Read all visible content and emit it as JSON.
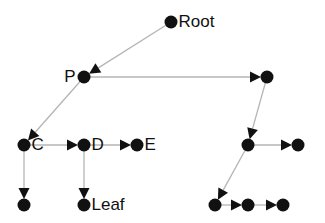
{
  "diagram": {
    "type": "tree",
    "colors": {
      "node": "#111111",
      "edge": "#b5b5b5",
      "arrow": "#111111",
      "label": "#111111",
      "background": "#ffffff"
    },
    "nodes": [
      {
        "id": "root",
        "label": "Root",
        "x": 171,
        "y": 22
      },
      {
        "id": "p",
        "label": "P",
        "x": 84,
        "y": 77,
        "label_side": "left"
      },
      {
        "id": "p_right",
        "label": "",
        "x": 267,
        "y": 77
      },
      {
        "id": "c",
        "label": "C",
        "x": 24,
        "y": 145
      },
      {
        "id": "d",
        "label": "D",
        "x": 84,
        "y": 145
      },
      {
        "id": "e",
        "label": "E",
        "x": 137,
        "y": 145
      },
      {
        "id": "r1",
        "label": "",
        "x": 248,
        "y": 145
      },
      {
        "id": "r1_right",
        "label": "",
        "x": 298,
        "y": 145
      },
      {
        "id": "c_child",
        "label": "",
        "x": 24,
        "y": 205
      },
      {
        "id": "leaf",
        "label": "Leaf",
        "x": 84,
        "y": 205
      },
      {
        "id": "r2",
        "label": "",
        "x": 215,
        "y": 205
      },
      {
        "id": "r2b",
        "label": "",
        "x": 248,
        "y": 205
      },
      {
        "id": "r2c",
        "label": "",
        "x": 283,
        "y": 205
      }
    ],
    "edges": [
      {
        "from": "root",
        "to": "p"
      },
      {
        "from": "p",
        "to": "p_right"
      },
      {
        "from": "p",
        "to": "c"
      },
      {
        "from": "c",
        "to": "d"
      },
      {
        "from": "d",
        "to": "e"
      },
      {
        "from": "c",
        "to": "c_child"
      },
      {
        "from": "d",
        "to": "leaf"
      },
      {
        "from": "p_right",
        "to": "r1"
      },
      {
        "from": "r1",
        "to": "r1_right"
      },
      {
        "from": "r1",
        "to": "r2"
      },
      {
        "from": "r2",
        "to": "r2b"
      },
      {
        "from": "r2b",
        "to": "r2c"
      }
    ]
  }
}
